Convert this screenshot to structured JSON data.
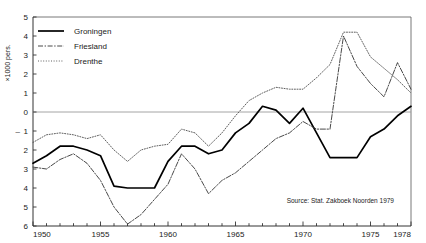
{
  "chart_data": {
    "type": "line",
    "title": "",
    "xlabel": "",
    "ylabel": "×1000 pers.",
    "xlim": [
      1950,
      1978
    ],
    "ylim": [
      -6,
      5
    ],
    "grid": false,
    "zero_line": true,
    "legend_position": "top-left",
    "source": "Source: Stat. Zakboek Noorden 1979",
    "x_tick_labels": [
      "1950",
      "1955",
      "1960",
      "1965",
      "1970",
      "1975",
      "1978"
    ],
    "x_tick_values": [
      1950,
      1955,
      1960,
      1965,
      1970,
      1975,
      1978
    ],
    "x_minor_step": 1,
    "y_tick_labels": [
      "5",
      "4",
      "3",
      "2",
      "1",
      "0",
      "1",
      "2",
      "3",
      "4",
      "5",
      "6"
    ],
    "y_tick_values": [
      5,
      4,
      3,
      2,
      1,
      0,
      -1,
      -2,
      -3,
      -4,
      -5,
      -6
    ],
    "y_negative_marker": "–",
    "x": [
      1950,
      1951,
      1952,
      1953,
      1954,
      1955,
      1956,
      1957,
      1958,
      1959,
      1960,
      1961,
      1962,
      1963,
      1964,
      1965,
      1966,
      1967,
      1968,
      1969,
      1970,
      1971,
      1972,
      1973,
      1974,
      1975,
      1976,
      1977,
      1978
    ],
    "series": [
      {
        "name": "Groningen",
        "style": "solid",
        "color": "#000000",
        "values": [
          -2.7,
          -2.3,
          -1.8,
          -1.8,
          -2.0,
          -2.3,
          -3.9,
          -4.0,
          -4.0,
          -4.0,
          -2.6,
          -1.8,
          -1.8,
          -2.2,
          -2.0,
          -1.1,
          -0.6,
          0.3,
          0.1,
          -0.6,
          0.2,
          -1.1,
          -2.4,
          -2.4,
          -2.4,
          -1.3,
          -0.9,
          -0.2,
          0.3
        ]
      },
      {
        "name": "Friesland",
        "style": "dashdot",
        "color": "#333333",
        "values": [
          -2.9,
          -3.0,
          -2.5,
          -2.2,
          -2.7,
          -3.6,
          -5.0,
          -5.9,
          -5.4,
          -4.6,
          -3.8,
          -2.2,
          -3.0,
          -4.3,
          -3.6,
          -3.2,
          -2.6,
          -2.0,
          -1.4,
          -1.1,
          -0.5,
          -0.9,
          -0.9,
          4.0,
          2.4,
          1.5,
          0.8,
          2.6,
          1.2
        ]
      },
      {
        "name": "Drenthe",
        "style": "dotted",
        "color": "#4d4d4d",
        "values": [
          -1.6,
          -1.2,
          -1.1,
          -1.2,
          -1.4,
          -1.2,
          -2.0,
          -2.6,
          -2.0,
          -1.8,
          -1.7,
          -0.9,
          -1.1,
          -1.8,
          -1.1,
          -0.2,
          0.6,
          1.0,
          1.3,
          1.2,
          1.2,
          1.8,
          2.5,
          4.2,
          4.2,
          2.9,
          2.3,
          1.7,
          1.0
        ]
      }
    ]
  },
  "legend": {
    "items": [
      {
        "label": "Groningen",
        "style": "solid"
      },
      {
        "label": "Friesland",
        "style": "dashdot"
      },
      {
        "label": "Drenthe",
        "style": "dotted"
      }
    ]
  }
}
